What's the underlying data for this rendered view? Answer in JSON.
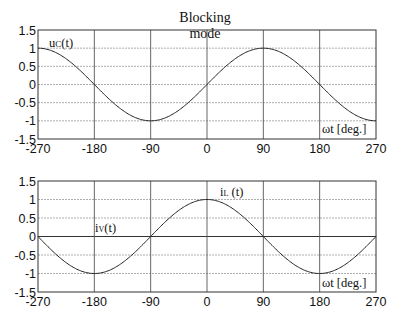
{
  "title": {
    "line1": "Blocking",
    "line2": "mode"
  },
  "chart_data": [
    {
      "type": "line",
      "name": "top-plot",
      "title": "Blocking mode",
      "xlabel": "ωt [deg.]",
      "ylabel": "",
      "xlim": [
        -270,
        270
      ],
      "ylim": [
        -1.5,
        1.5
      ],
      "xticks": [
        -270,
        -180,
        -90,
        0,
        90,
        180,
        270
      ],
      "yticks": [
        1.5,
        1,
        0.5,
        0,
        -0.5,
        -1,
        -1.5
      ],
      "xtick_labels": [
        "-270",
        "-180",
        "-90",
        "0",
        "90",
        "180",
        "270"
      ],
      "ytick_labels": [
        "1.5",
        "1",
        "0.5",
        "0",
        "-0.5",
        "-1",
        "-1.5"
      ],
      "grid": true,
      "series": [
        {
          "name": "uc(t)",
          "function": "sin(ωt)",
          "x": [
            -270,
            -225,
            -180,
            -135,
            -90,
            -45,
            0,
            45,
            90,
            135,
            180,
            225,
            270
          ],
          "values": [
            1,
            0.71,
            0,
            -0.71,
            -1,
            -0.71,
            0,
            0.71,
            1,
            0.71,
            0,
            -0.71,
            -1
          ]
        }
      ],
      "annotations": [
        {
          "text": "uc(t)",
          "x": -250,
          "y": 1.25
        },
        {
          "text": "ωt [deg.]",
          "x": 185,
          "y": -1.2
        }
      ]
    },
    {
      "type": "line",
      "name": "bottom-plot",
      "xlabel": "ωt [deg.]",
      "ylabel": "",
      "xlim": [
        -270,
        270
      ],
      "ylim": [
        -1.5,
        1.5
      ],
      "xticks": [
        -270,
        -180,
        -90,
        0,
        90,
        180,
        270
      ],
      "yticks": [
        1.5,
        1,
        0.5,
        0,
        -0.5,
        -1,
        -1.5
      ],
      "xtick_labels": [
        "-270",
        "-180",
        "-90",
        "0",
        "90",
        "180",
        "270"
      ],
      "ytick_labels": [
        "1.5",
        "1",
        "0.5",
        "0",
        "-0.5",
        "-1",
        "-1.5"
      ],
      "grid": true,
      "series": [
        {
          "name": "iv(t) / iL(t)",
          "function": "cos(ωt)",
          "x": [
            -270,
            -225,
            -180,
            -135,
            -90,
            -45,
            0,
            45,
            90,
            135,
            180,
            225,
            270
          ],
          "values": [
            0,
            -0.71,
            -1,
            -0.71,
            0,
            0.71,
            1,
            0.71,
            0,
            -0.71,
            -1,
            -0.71,
            0
          ]
        }
      ],
      "annotations": [
        {
          "text": "iv(t)",
          "x": -180,
          "y": 0.4
        },
        {
          "text": "iL (t)",
          "x": 22,
          "y": 1.25
        },
        {
          "text": "ωt [deg.]",
          "x": 185,
          "y": -1.2
        }
      ]
    }
  ],
  "labels": {
    "uc": {
      "main": "u",
      "sub": "C",
      "rest": "(t)"
    },
    "il": {
      "main": "i",
      "sub": "L",
      "rest": " (t)"
    },
    "iv": {
      "main": "i",
      "sub": "V",
      "rest": "(t)"
    },
    "xlabel": "ωt [deg.]"
  },
  "colors": {
    "curve": "#222222",
    "axis": "#333333",
    "vgrid": "#555555",
    "hgrid": "#999999",
    "zero_line": "#333333"
  }
}
